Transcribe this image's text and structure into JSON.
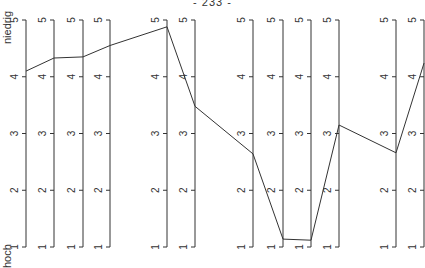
{
  "page_number": "- 233 -",
  "labels": {
    "top": "niedrig",
    "bottom": "hoch"
  },
  "chart_data": {
    "type": "line",
    "title": "",
    "xlabel": "",
    "ylabel_top": "niedrig",
    "ylabel_bottom": "hoch",
    "ylim": [
      1,
      5
    ],
    "ticks": [
      1,
      2,
      3,
      4,
      5
    ],
    "grid": false,
    "axes_x_px": [
      26,
      54,
      83,
      110,
      167,
      195,
      253,
      283,
      311,
      339,
      396,
      424
    ],
    "values": [
      4.1,
      4.33,
      4.35,
      4.55,
      4.88,
      3.48,
      2.64,
      1.14,
      1.12,
      3.15,
      2.66,
      4.24
    ],
    "colors": {
      "line": "#333333",
      "axis": "#333333"
    }
  }
}
